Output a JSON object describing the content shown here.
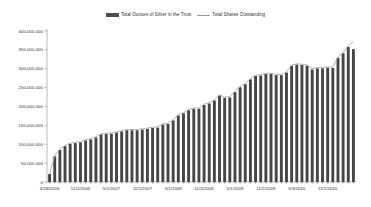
{
  "legend": {
    "position": "top-center",
    "entries": [
      {
        "label": "Total Ounces of Silver in the Trust",
        "marker": "bar-swatch-icon",
        "color": "#454545"
      },
      {
        "label": "Total Shares Outstanding",
        "marker": "line-swatch-icon",
        "color": "#a8a8a8"
      }
    ]
  },
  "axes": {
    "y_tick_labels": [
      "400,000,000",
      "350,000,000",
      "300,000,000",
      "250,000,000",
      "200,000,000",
      "150,000,000",
      "100,000,000",
      "50,000,000",
      "0"
    ],
    "x_tick_labels": [
      "4/28/2006",
      "11/1/2006",
      "5/1/2007",
      "11/1/2007",
      "5/1/2008",
      "11/3/2008",
      "5/1/2009",
      "11/2/2009",
      "5/3/2010",
      "11/1/2010"
    ]
  },
  "chart_data": {
    "type": "bar",
    "title": "",
    "subtitle": "",
    "xlabel": "",
    "ylabel": "",
    "ylim": [
      0,
      400000000
    ],
    "ytick_step": 50000000,
    "grid": false,
    "legend_position": "top-center",
    "categories": [
      "4/28/2006",
      "5/31/2006",
      "6/30/2006",
      "7/31/2006",
      "8/31/2006",
      "9/29/2006",
      "11/1/2006",
      "11/30/2006",
      "12/29/2006",
      "1/31/2007",
      "2/28/2007",
      "3/30/2007",
      "5/1/2007",
      "5/31/2007",
      "6/29/2007",
      "7/31/2007",
      "8/31/2007",
      "9/28/2007",
      "11/1/2007",
      "11/30/2007",
      "12/31/2007",
      "1/31/2008",
      "2/29/2008",
      "3/31/2008",
      "5/1/2008",
      "5/30/2008",
      "6/30/2008",
      "7/31/2008",
      "8/29/2008",
      "9/30/2008",
      "11/3/2008",
      "11/28/2008",
      "12/31/2008",
      "1/30/2009",
      "2/27/2009",
      "3/31/2009",
      "5/1/2009",
      "5/29/2009",
      "6/30/2009",
      "7/31/2009",
      "8/31/2009",
      "9/30/2009",
      "11/2/2009",
      "11/30/2009",
      "12/31/2009",
      "1/29/2010",
      "2/26/2010",
      "3/31/2010",
      "5/3/2010",
      "5/28/2010",
      "6/30/2010",
      "7/30/2010",
      "8/31/2010",
      "9/30/2010",
      "11/1/2010",
      "11/30/2010",
      "12/31/2010",
      "1/31/2011",
      "2/28/2011",
      "3/31/2011"
    ],
    "series": [
      {
        "name": "Total Ounces of Silver in the Trust",
        "chart_type": "bar",
        "color": "#454545",
        "values": [
          21000000,
          68000000,
          85000000,
          95000000,
          101000000,
          103000000,
          105000000,
          110000000,
          113000000,
          118000000,
          126000000,
          127000000,
          128000000,
          131000000,
          134000000,
          137000000,
          137000000,
          137000000,
          139000000,
          141000000,
          143000000,
          144000000,
          152000000,
          154000000,
          163000000,
          176000000,
          182000000,
          190000000,
          194000000,
          194000000,
          204000000,
          208000000,
          216000000,
          229000000,
          223000000,
          224000000,
          238000000,
          251000000,
          259000000,
          272000000,
          281000000,
          282000000,
          286000000,
          286000000,
          283000000,
          283000000,
          290000000,
          308000000,
          311000000,
          310000000,
          308000000,
          298000000,
          301000000,
          301000000,
          303000000,
          302000000,
          329000000,
          341000000,
          358000000,
          352000000
        ]
      },
      {
        "name": "Total Shares Outstanding",
        "chart_type": "line",
        "color": "#a8a8a8",
        "values": [
          22000000,
          70000000,
          87000000,
          97000000,
          103000000,
          105000000,
          107000000,
          112000000,
          115000000,
          120000000,
          128000000,
          129000000,
          130000000,
          133000000,
          136000000,
          139000000,
          139000000,
          139000000,
          141000000,
          143000000,
          145000000,
          146000000,
          154000000,
          156000000,
          165000000,
          178000000,
          184000000,
          192000000,
          196000000,
          196000000,
          206000000,
          210000000,
          218000000,
          231000000,
          225000000,
          226000000,
          240000000,
          253000000,
          261000000,
          274000000,
          283000000,
          284000000,
          288000000,
          288000000,
          285000000,
          285000000,
          292000000,
          310000000,
          313000000,
          312000000,
          310000000,
          300000000,
          303000000,
          303000000,
          305000000,
          304000000,
          331000000,
          343000000,
          361000000,
          372000000
        ]
      }
    ]
  }
}
